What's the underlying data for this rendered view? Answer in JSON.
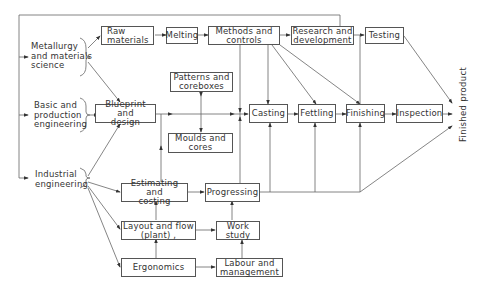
{
  "diagram": {
    "sources": [
      {
        "id": "metallurgy",
        "label": "Metallurgy\nand materials\nscience"
      },
      {
        "id": "basic",
        "label": "Basic and\nproduction\nengineering"
      },
      {
        "id": "industrial",
        "label": "Industrial\nengineering"
      }
    ],
    "boxes": {
      "raw_materials": "Raw\nmaterials",
      "melting": "Melting",
      "methods": "Methods and\ncontrols",
      "research": "Research and\ndevelopment",
      "testing": "Testing",
      "patterns": "Patterns and\ncoreboxes",
      "blueprint": "Blueprint and\ndesign",
      "moulds": "Moulds and\ncores",
      "casting": "Casting",
      "fettling": "Fettling",
      "finishing": "Finishing",
      "inspection": "Inspection",
      "estimating": "Estimating and\ncosting",
      "progressing": "Progressing",
      "layout": "Layout and flow\n(plant) ,",
      "work_study": "Work\nstudy",
      "ergonomics": "Ergonomics",
      "labour": "Labour and\nmanagement"
    },
    "output_label": "Finished product",
    "line_color": "#555555"
  }
}
